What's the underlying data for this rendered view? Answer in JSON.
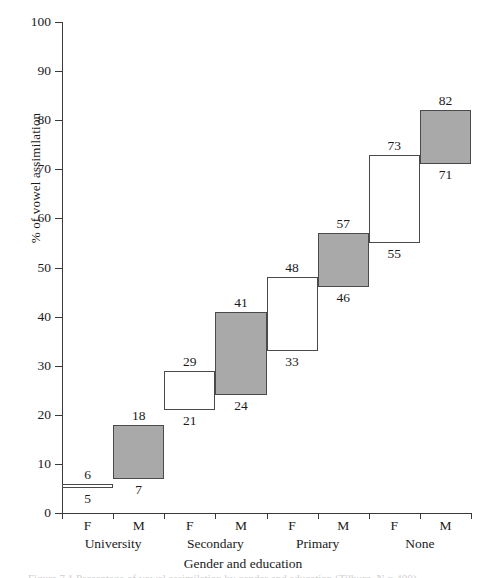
{
  "chart_data": {
    "type": "bar",
    "title": "",
    "xlabel": "Gender and education",
    "ylabel": "% of vowel assimilation",
    "ylim": [
      0,
      100
    ],
    "yticks": [
      0,
      10,
      20,
      30,
      40,
      50,
      60,
      70,
      80,
      90,
      100
    ],
    "grid": false,
    "legend": "none",
    "categories": [
      "F",
      "M",
      "F",
      "M",
      "F",
      "M",
      "F",
      "M"
    ],
    "groups": [
      "University",
      "Secondary",
      "Primary",
      "None"
    ],
    "note": "Step/range bars: each bar spans from its lower value to its upper value; F bars unfilled (white), M bars shaded grey.",
    "bars": [
      {
        "group": "University",
        "gender": "F",
        "low": 5,
        "high": 6,
        "fill": "white"
      },
      {
        "group": "University",
        "gender": "M",
        "low": 7,
        "high": 18,
        "fill": "grey"
      },
      {
        "group": "Secondary",
        "gender": "F",
        "low": 21,
        "high": 29,
        "fill": "white"
      },
      {
        "group": "Secondary",
        "gender": "M",
        "low": 24,
        "high": 41,
        "fill": "grey"
      },
      {
        "group": "Primary",
        "gender": "F",
        "low": 33,
        "high": 48,
        "fill": "white"
      },
      {
        "group": "Primary",
        "gender": "M",
        "low": 46,
        "high": 57,
        "fill": "grey"
      },
      {
        "group": "None",
        "gender": "F",
        "low": 55,
        "high": 73,
        "fill": "white"
      },
      {
        "group": "None",
        "gender": "M",
        "low": 71,
        "high": 82,
        "fill": "grey"
      }
    ],
    "series": [
      {
        "name": "lower bound",
        "values": [
          5,
          7,
          21,
          24,
          33,
          46,
          55,
          71
        ]
      },
      {
        "name": "upper bound",
        "values": [
          6,
          18,
          29,
          41,
          48,
          57,
          73,
          82
        ]
      }
    ]
  },
  "colors": {
    "shaded_fill": "#a9a9a9",
    "unfilled_fill": "#ffffff",
    "stroke": "#4a4a4a",
    "axis": "#3a3a3a",
    "text": "#1a1a1a"
  },
  "caption": {
    "text": "Figure 7.1  Percentage of vowel assimilation by gender and education (Tilburg, N = 400)"
  }
}
